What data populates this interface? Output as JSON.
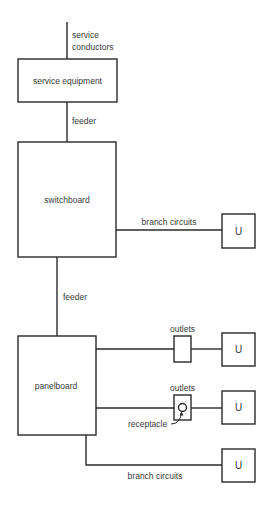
{
  "diagram": {
    "type": "electrical distribution block diagram",
    "nodes": {
      "service_equipment": {
        "label": "service equipment"
      },
      "switchboard": {
        "label": "switchboard"
      },
      "panelboard": {
        "label": "panelboard"
      },
      "utilization_1": {
        "label": "U"
      },
      "utilization_2": {
        "label": "U"
      },
      "utilization_3": {
        "label": "U"
      },
      "utilization_4": {
        "label": "U"
      },
      "outlet_1": {
        "label": "outlets"
      },
      "outlet_2": {
        "label": "outlets"
      }
    },
    "labels": {
      "service_conductors_line1": "service",
      "service_conductors_line2": "conductors",
      "feeder_1": "feeder",
      "feeder_2": "feeder",
      "branch_circuits_1": "branch circuits",
      "branch_circuits_2": "branch circuits",
      "receptacle": "receptacle"
    },
    "edges": [
      {
        "from": "service conductors",
        "to": "service_equipment",
        "label": "service conductors"
      },
      {
        "from": "service_equipment",
        "to": "switchboard",
        "label": "feeder"
      },
      {
        "from": "switchboard",
        "to": "utilization_1",
        "label": "branch circuits"
      },
      {
        "from": "switchboard",
        "to": "panelboard",
        "label": "feeder"
      },
      {
        "from": "panelboard",
        "to": "outlet_1",
        "label": ""
      },
      {
        "from": "outlet_1",
        "to": "utilization_2",
        "label": ""
      },
      {
        "from": "panelboard",
        "to": "outlet_2",
        "label": ""
      },
      {
        "from": "outlet_2",
        "to": "utilization_3",
        "label": ""
      },
      {
        "from": "panelboard",
        "to": "utilization_4",
        "label": "branch circuits"
      }
    ]
  }
}
